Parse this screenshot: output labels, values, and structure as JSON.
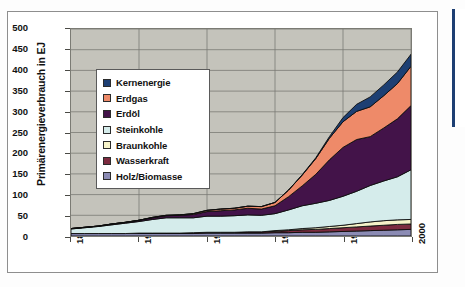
{
  "figure": {
    "background_color": "#ffffff",
    "plot_background_color": "#c4c3bb",
    "frame_color": "#8e8e8e",
    "right_edge_accent_color": "#1d3f73"
  },
  "chart_data": {
    "type": "area",
    "stacked": true,
    "title": "",
    "subtitle": "",
    "xlabel": "",
    "ylabel": "Primärenergieverbrauch in EJ",
    "xlim": [
      1875,
      2000
    ],
    "ylim": [
      0,
      500
    ],
    "xticks": [
      1875,
      1900,
      1925,
      1950,
      1975,
      2000
    ],
    "xticklabels": [
      "1875",
      "1900",
      "1925",
      "1950",
      "1975",
      "2000"
    ],
    "yticks": [
      0,
      50,
      100,
      150,
      200,
      250,
      300,
      350,
      400,
      450,
      500
    ],
    "yticklabels": [
      "0",
      "50",
      "100",
      "150",
      "200",
      "250",
      "300",
      "350",
      "400",
      "450",
      "500"
    ],
    "grid": true,
    "grid_color": "#7b7b74",
    "legend_position": "upper-left-inside",
    "stack_order_bottom_to_top": [
      "Holz/Biomasse",
      "Wasserkraft",
      "Braunkohle",
      "Steinkohle",
      "Erdöl",
      "Erdgas",
      "Kernenergie"
    ],
    "x": [
      1875,
      1880,
      1885,
      1890,
      1895,
      1900,
      1905,
      1910,
      1915,
      1920,
      1925,
      1930,
      1935,
      1940,
      1945,
      1950,
      1955,
      1960,
      1965,
      1970,
      1975,
      1980,
      1985,
      1990,
      1995,
      2000
    ],
    "series": [
      {
        "name": "Holz/Biomasse",
        "color": "#8b8bb4",
        "values": [
          6,
          6,
          6,
          6,
          6,
          6,
          6,
          6,
          6,
          6,
          7,
          7,
          7,
          7,
          7,
          8,
          8,
          9,
          9,
          10,
          11,
          12,
          13,
          14,
          15,
          16
        ]
      },
      {
        "name": "Wasserkraft",
        "color": "#7c2b3f",
        "values": [
          0,
          0,
          0,
          0,
          0,
          1,
          1,
          1,
          1,
          2,
          2,
          2,
          2,
          3,
          3,
          3,
          5,
          6,
          7,
          8,
          9,
          10,
          11,
          12,
          13,
          13
        ]
      },
      {
        "name": "Braunkohle",
        "color": "#f6f3c9",
        "values": [
          0,
          0,
          0,
          0,
          0,
          0,
          0,
          0,
          0,
          0,
          0,
          0,
          0,
          0,
          0,
          2,
          2,
          3,
          4,
          5,
          6,
          8,
          10,
          11,
          11,
          11
        ]
      },
      {
        "name": "Steinkohle",
        "color": "#d5eceb",
        "values": [
          11,
          14,
          17,
          21,
          25,
          28,
          33,
          37,
          37,
          36,
          39,
          39,
          40,
          41,
          40,
          41,
          48,
          55,
          59,
          63,
          70,
          78,
          88,
          96,
          104,
          120
        ]
      },
      {
        "name": "Erdöl",
        "color": "#431349",
        "values": [
          1,
          1,
          1,
          2,
          2,
          3,
          4,
          5,
          6,
          8,
          11,
          13,
          14,
          16,
          15,
          19,
          32,
          48,
          70,
          98,
          118,
          125,
          118,
          128,
          140,
          155
        ]
      },
      {
        "name": "Erdgas",
        "color": "#ee8a69",
        "values": [
          0,
          0,
          0,
          0,
          0,
          0,
          1,
          1,
          1,
          2,
          3,
          4,
          4,
          5,
          6,
          8,
          16,
          26,
          38,
          52,
          62,
          68,
          72,
          78,
          85,
          95
        ]
      },
      {
        "name": "Kernenergie",
        "color": "#1d3f73",
        "values": [
          0,
          0,
          0,
          0,
          0,
          0,
          0,
          0,
          0,
          0,
          0,
          0,
          0,
          0,
          0,
          0,
          0,
          1,
          2,
          4,
          10,
          17,
          24,
          26,
          28,
          29
        ]
      }
    ],
    "totals": [
      18,
      21,
      24,
      29,
      33,
      38,
      45,
      50,
      51,
      54,
      62,
      65,
      67,
      72,
      71,
      81,
      111,
      148,
      189,
      240,
      286,
      318,
      336,
      365,
      396,
      439
    ]
  },
  "legend": {
    "items": [
      {
        "label": "Kernenergie",
        "color": "#1d3f73"
      },
      {
        "label": "Erdgas",
        "color": "#ee8a69"
      },
      {
        "label": "Erdöl",
        "color": "#431349"
      },
      {
        "label": "Steinkohle",
        "color": "#d5eceb"
      },
      {
        "label": "Braunkohle",
        "color": "#f6f3c9"
      },
      {
        "label": "Wasserkraft",
        "color": "#7c2b3f"
      },
      {
        "label": "Holz/Biomasse",
        "color": "#8b8bb4"
      }
    ]
  }
}
